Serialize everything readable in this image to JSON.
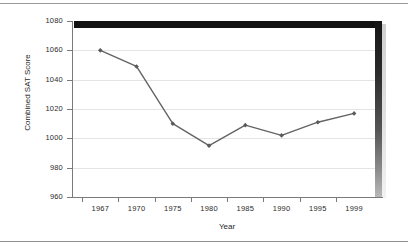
{
  "chart_data": {
    "type": "line",
    "title": "",
    "xlabel": "Year",
    "ylabel": "Combined SAT Score",
    "categories": [
      "1967",
      "1970",
      "1975",
      "1980",
      "1985",
      "1990",
      "1995",
      "1999"
    ],
    "values": [
      1060,
      1049,
      1010,
      995,
      1009,
      1002,
      1011,
      1017
    ],
    "series": [
      {
        "name": "Combined SAT Score",
        "values": [
          1060,
          1049,
          1010,
          995,
          1009,
          1002,
          1011,
          1017
        ]
      }
    ],
    "ylim": [
      960,
      1080
    ],
    "yticks": [
      960,
      980,
      1000,
      1020,
      1040,
      1060,
      1080
    ],
    "ytick_labels": [
      "960",
      "980",
      "1000",
      "1020",
      "1040",
      "1060",
      "1080"
    ],
    "xtick_labels": [
      "1967",
      "1970",
      "1975",
      "1980",
      "1985",
      "1990",
      "1995",
      "1999"
    ],
    "grid": true,
    "legend": "none",
    "marker": "diamond",
    "line_color": "#646464",
    "marker_color": "#5a5a5a",
    "grid_color": "#e4e4e4",
    "axis_color": "#7a7a7a",
    "frame_color": "#121212",
    "background_color": "#ffffff"
  }
}
